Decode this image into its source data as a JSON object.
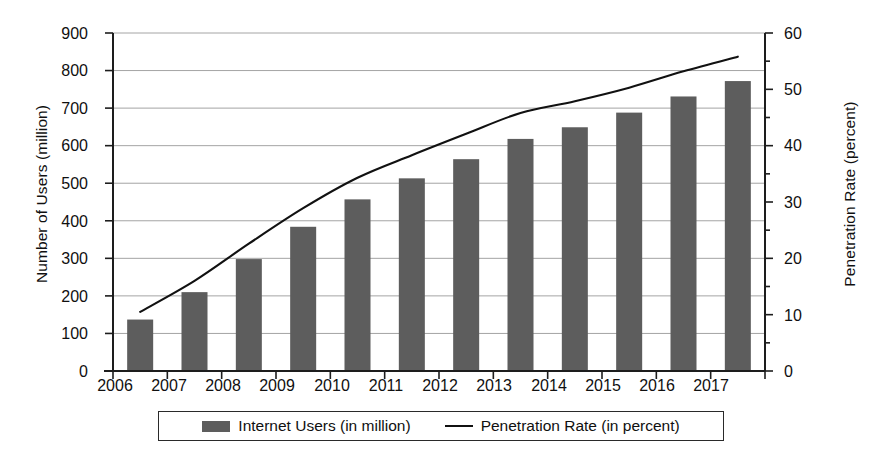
{
  "chart_data": {
    "type": "bar",
    "title": "",
    "categories": [
      "2006",
      "2007",
      "2008",
      "2009",
      "2010",
      "2011",
      "2012",
      "2013",
      "2014",
      "2015",
      "2016",
      "2017"
    ],
    "series": [
      {
        "name": "Internet Users (in million)",
        "type": "bar",
        "axis": "left",
        "color": "#5d5d5d",
        "values": [
          137,
          210,
          298,
          384,
          457,
          513,
          564,
          618,
          649,
          688,
          731,
          772
        ]
      },
      {
        "name": "Penetration Rate (in percent)",
        "type": "line",
        "axis": "right",
        "color": "#111111",
        "values": [
          10.5,
          16.0,
          22.6,
          28.9,
          34.3,
          38.3,
          42.1,
          45.8,
          47.9,
          50.3,
          53.2,
          55.8
        ]
      }
    ],
    "xlabel": "",
    "ylabel_left": "Number of Users (million)",
    "ylabel_right": "Penetration Rate (percent)",
    "ylim_left": [
      0,
      900
    ],
    "ylim_right": [
      0,
      60
    ],
    "ytick_left": [
      "0",
      "100",
      "200",
      "300",
      "400",
      "500",
      "600",
      "700",
      "800",
      "900"
    ],
    "ytick_right": [
      "0",
      "10",
      "20",
      "30",
      "40",
      "50",
      "60"
    ],
    "ytick_right_minor_step": 5,
    "grid": "horizontal",
    "legend_position": "bottom-center",
    "legend_entries": [
      {
        "label": "Internet Users (in million)",
        "marker": "swatch"
      },
      {
        "label": "Penetration Rate (in percent)",
        "marker": "line"
      }
    ]
  },
  "colors": {
    "bar": "#5d5d5d",
    "line": "#111111",
    "grid": "#9a9a9a",
    "axis": "#1d1d1d",
    "background": "#ffffff"
  }
}
